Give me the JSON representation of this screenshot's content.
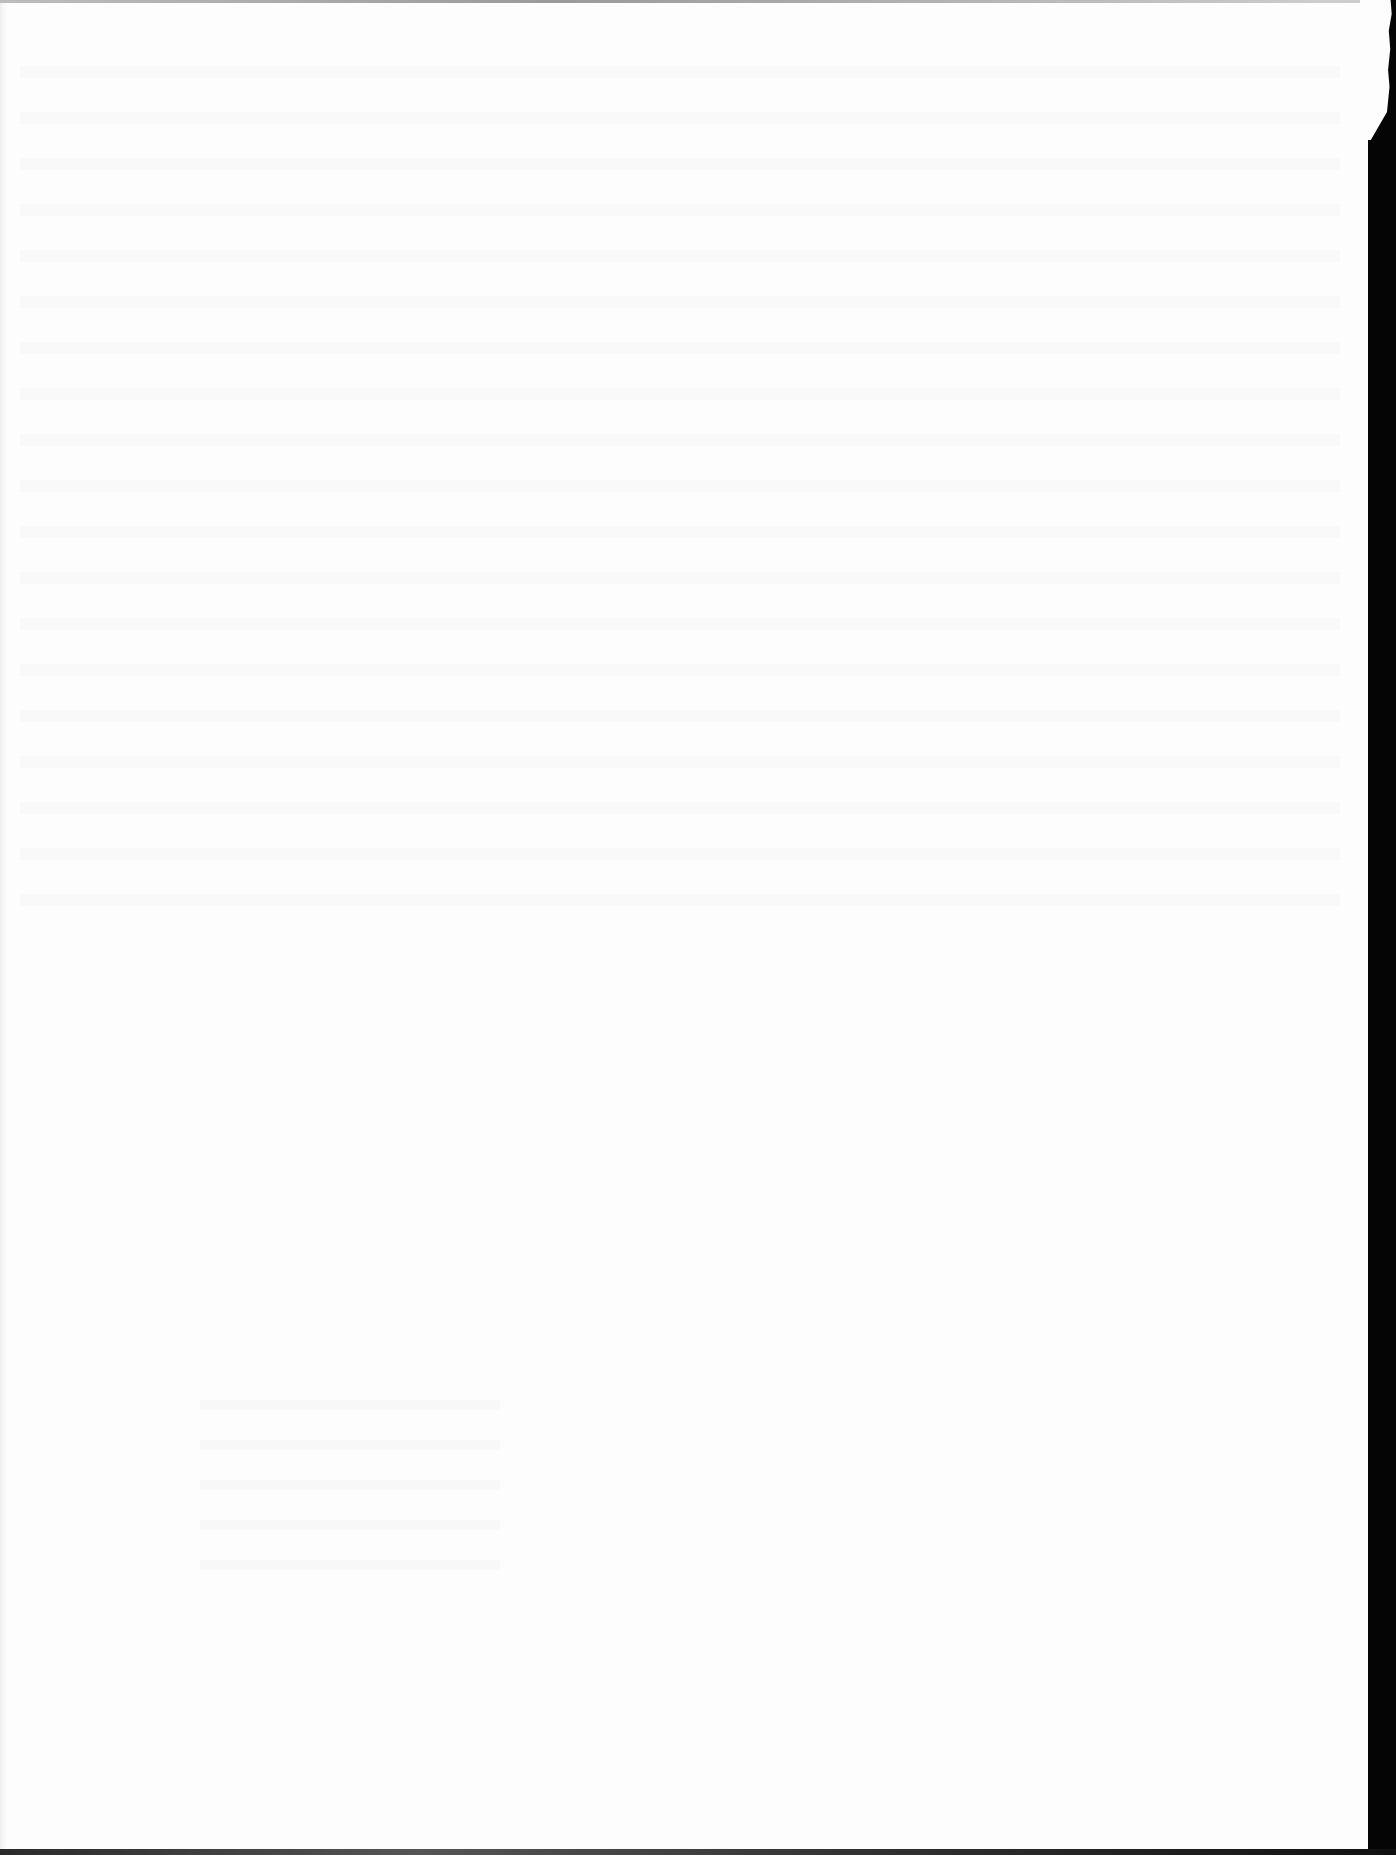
{
  "document": {
    "description": "Blank scanned page",
    "text": "",
    "page_color": "#fdfdfd",
    "margin_color": "#050505",
    "features": [
      "faint illegible bleed-through text",
      "torn right edge",
      "dark scan border on right and bottom"
    ]
  }
}
